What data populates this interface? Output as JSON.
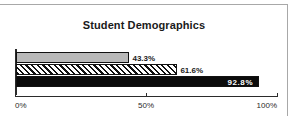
{
  "chart_data": {
    "type": "bar",
    "orientation": "horizontal",
    "title": "Student Demographics",
    "xlabel": "",
    "ylabel": "",
    "xlim": [
      0,
      100
    ],
    "grid": false,
    "legend": "none",
    "tick_labels": [
      "0%",
      "50%",
      "100%"
    ],
    "tick_values": [
      0,
      50,
      100
    ],
    "categories": [
      "",
      "",
      ""
    ],
    "values": [
      43.3,
      61.6,
      92.8
    ],
    "data_labels": [
      "43.3%",
      "61.6%",
      "92.8%"
    ],
    "series": [
      {
        "name": "series-1",
        "value": 43.3,
        "label": "43.3%",
        "fill": "gray",
        "label_position": "outside"
      },
      {
        "name": "series-2",
        "value": 61.6,
        "label": "61.6%",
        "fill": "hatch",
        "label_position": "outside"
      },
      {
        "name": "series-3",
        "value": 92.8,
        "label": "92.8%",
        "fill": "black",
        "label_position": "inside"
      }
    ],
    "colors": {
      "bar_gray": "#b9b9b9",
      "bar_black": "#0b0b0b",
      "bar_outline": "#111111",
      "axis": "#2b2b2b",
      "frame": "#a8a8a8",
      "text": "#1a1a1a",
      "inside_label_text": "#ffffff",
      "background": "#ffffff"
    }
  }
}
